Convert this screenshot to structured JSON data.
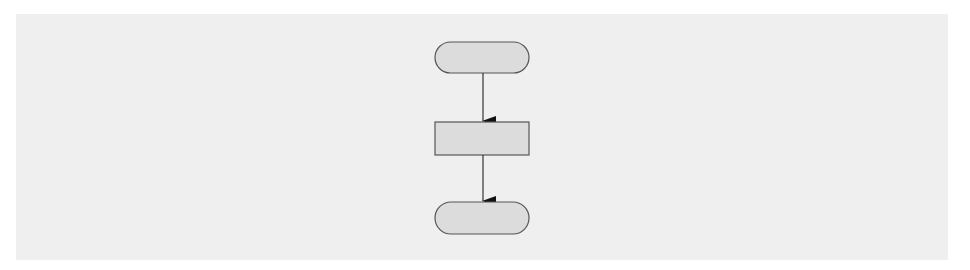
{
  "diagram": {
    "type": "flowchart",
    "background_color": "#efefef",
    "shape_fill": "#dcdcdc",
    "stroke_color": "#555555",
    "arrow_color": "#111111",
    "nodes": [
      {
        "id": "start",
        "shape": "terminator",
        "label": ""
      },
      {
        "id": "process",
        "shape": "process",
        "label": ""
      },
      {
        "id": "end",
        "shape": "terminator",
        "label": ""
      }
    ],
    "edges": [
      {
        "from": "start",
        "to": "process"
      },
      {
        "from": "process",
        "to": "end"
      }
    ]
  }
}
